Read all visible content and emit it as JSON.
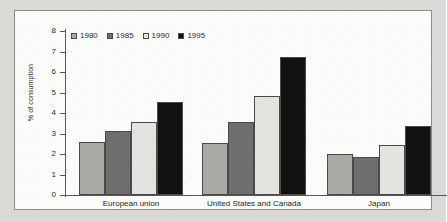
{
  "chart_data": {
    "type": "bar",
    "title": "",
    "xlabel": "",
    "ylabel": "% of consumption",
    "ylim": [
      0,
      8
    ],
    "ytick_labels": [
      "8",
      "7",
      "6",
      "5",
      "4",
      "3",
      "2",
      "1",
      "0"
    ],
    "yticks": [
      8,
      7,
      6,
      5,
      4,
      3,
      2,
      1,
      0
    ],
    "grid": false,
    "legend_position": "top-left",
    "categories": [
      "European union",
      "United States and Canada",
      "Japan"
    ],
    "series": [
      {
        "name": "1980",
        "color": "#a9a9a6",
        "values": [
          2.6,
          2.55,
          2.0
        ]
      },
      {
        "name": "1985",
        "color": "#6e6e6c",
        "values": [
          3.1,
          3.55,
          1.85
        ]
      },
      {
        "name": "1990",
        "color": "#e3e3e0",
        "values": [
          3.55,
          4.85,
          2.45
        ]
      },
      {
        "name": "1995",
        "color": "#111111",
        "values": [
          4.55,
          6.75,
          3.35
        ]
      }
    ]
  },
  "figure": {
    "panel_background": "#fbfbfa",
    "page_background": "#d9d9d6",
    "axis_color": "#575754",
    "text_color": "#2b2b2b"
  }
}
